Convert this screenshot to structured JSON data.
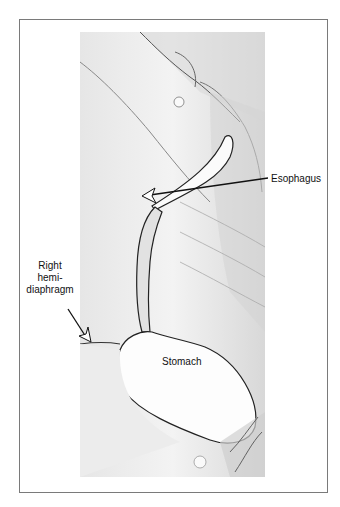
{
  "figure": {
    "type": "radiograph (barium swallow)",
    "labels": {
      "esophagus": "Esophagus",
      "right_hemidiaphragm_line1": "Right",
      "right_hemidiaphragm_line2": "hemi-",
      "right_hemidiaphragm_line3": "diaphragm",
      "stomach": "Stomach"
    },
    "colors": {
      "frame_border": "#7a7a7a",
      "background": "#ffffff",
      "xray_base": "#f1f1f1",
      "line": "#111111"
    }
  }
}
